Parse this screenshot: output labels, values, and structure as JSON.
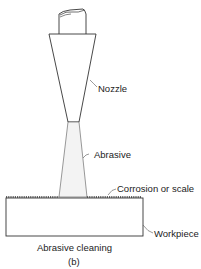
{
  "figure": {
    "title": "Abrasive cleaning",
    "sublabel": "(b)"
  },
  "labels": {
    "nozzle": "Nozzle",
    "abrasive": "Abrasive",
    "corrosion": "Corrosion or scale",
    "workpiece": "Workpiece"
  },
  "colors": {
    "line": "#333333",
    "abrasive_fill": "#f3f3f3",
    "background": "#ffffff"
  }
}
